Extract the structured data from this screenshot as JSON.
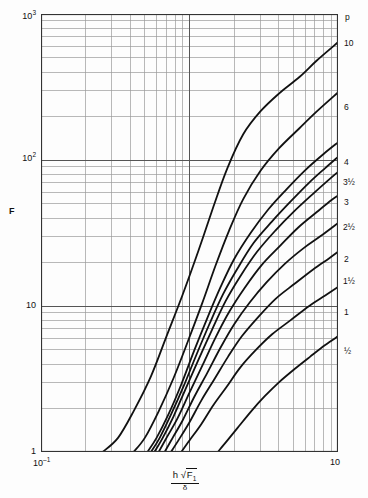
{
  "chart_data": {
    "type": "line",
    "title": "",
    "xlabel": "h √F₁ / δ",
    "ylabel": "F",
    "xscale": "log",
    "yscale": "log",
    "xlim": [
      0.1,
      10
    ],
    "ylim": [
      1,
      1000
    ],
    "grid": true,
    "legend_position": "right-edge-curve-labels",
    "legend_title": "p",
    "x_tick_labels": [
      "10⁻¹",
      "10"
    ],
    "y_tick_labels": [
      "10³",
      "10²",
      "10",
      "1"
    ],
    "y_tick_values": [
      1000,
      100,
      10,
      1
    ],
    "x_tick_values": [
      0.1,
      10
    ],
    "series": [
      {
        "name": "10",
        "label": "10",
        "points": [
          [
            0.26,
            1.0
          ],
          [
            0.33,
            1.25
          ],
          [
            0.42,
            1.9
          ],
          [
            0.55,
            3.3
          ],
          [
            0.7,
            6.2
          ],
          [
            0.9,
            12
          ],
          [
            1.15,
            24
          ],
          [
            1.45,
            48
          ],
          [
            1.8,
            88
          ],
          [
            2.3,
            150
          ],
          [
            3.0,
            215
          ],
          [
            4.0,
            285
          ],
          [
            5.5,
            370
          ],
          [
            7.2,
            480
          ],
          [
            10,
            640
          ]
        ]
      },
      {
        "name": "6",
        "label": "6",
        "points": [
          [
            0.42,
            1.0
          ],
          [
            0.5,
            1.25
          ],
          [
            0.62,
            1.9
          ],
          [
            0.78,
            3.2
          ],
          [
            0.98,
            5.8
          ],
          [
            1.22,
            10.5
          ],
          [
            1.5,
            19
          ],
          [
            1.85,
            33
          ],
          [
            2.3,
            54
          ],
          [
            3.0,
            84
          ],
          [
            4.0,
            120
          ],
          [
            5.5,
            165
          ],
          [
            7.2,
            215
          ],
          [
            10,
            290
          ]
        ]
      },
      {
        "name": "4",
        "label": "4",
        "points": [
          [
            0.52,
            1.0
          ],
          [
            0.6,
            1.25
          ],
          [
            0.72,
            1.8
          ],
          [
            0.88,
            2.9
          ],
          [
            1.08,
            5.0
          ],
          [
            1.32,
            8.3
          ],
          [
            1.62,
            13.5
          ],
          [
            2.0,
            21
          ],
          [
            2.6,
            32
          ],
          [
            3.4,
            46
          ],
          [
            4.5,
            63
          ],
          [
            6.0,
            85
          ],
          [
            8.0,
            110
          ],
          [
            10,
            132
          ]
        ]
      },
      {
        "name": "3½",
        "label": "3½",
        "points": [
          [
            0.55,
            1.0
          ],
          [
            0.63,
            1.25
          ],
          [
            0.75,
            1.8
          ],
          [
            0.91,
            2.8
          ],
          [
            1.11,
            4.6
          ],
          [
            1.36,
            7.5
          ],
          [
            1.68,
            12
          ],
          [
            2.1,
            18
          ],
          [
            2.7,
            27
          ],
          [
            3.6,
            38
          ],
          [
            4.8,
            52
          ],
          [
            6.4,
            70
          ],
          [
            8.2,
            88
          ],
          [
            10,
            105
          ]
        ]
      },
      {
        "name": "3",
        "label": "3",
        "points": [
          [
            0.58,
            1.0
          ],
          [
            0.66,
            1.25
          ],
          [
            0.78,
            1.75
          ],
          [
            0.94,
            2.7
          ],
          [
            1.15,
            4.3
          ],
          [
            1.42,
            6.9
          ],
          [
            1.75,
            10.8
          ],
          [
            2.2,
            16
          ],
          [
            2.85,
            23.5
          ],
          [
            3.8,
            33
          ],
          [
            5.0,
            44
          ],
          [
            6.7,
            58
          ],
          [
            8.5,
            72
          ],
          [
            10,
            83
          ]
        ]
      },
      {
        "name": "2½",
        "label": "2½",
        "points": [
          [
            0.62,
            1.0
          ],
          [
            0.7,
            1.25
          ],
          [
            0.83,
            1.7
          ],
          [
            1.0,
            2.55
          ],
          [
            1.22,
            3.9
          ],
          [
            1.5,
            6.1
          ],
          [
            1.86,
            9.2
          ],
          [
            2.35,
            13.3
          ],
          [
            3.05,
            19
          ],
          [
            4.1,
            26
          ],
          [
            5.4,
            34.5
          ],
          [
            7.2,
            44
          ],
          [
            9.0,
            53
          ],
          [
            10,
            57
          ]
        ]
      },
      {
        "name": "2",
        "label": "2",
        "points": [
          [
            0.68,
            1.0
          ],
          [
            0.77,
            1.25
          ],
          [
            0.9,
            1.65
          ],
          [
            1.08,
            2.4
          ],
          [
            1.32,
            3.5
          ],
          [
            1.62,
            5.2
          ],
          [
            2.0,
            7.5
          ],
          [
            2.55,
            10.6
          ],
          [
            3.3,
            14.5
          ],
          [
            4.4,
            19.5
          ],
          [
            5.9,
            25
          ],
          [
            7.6,
            30
          ],
          [
            10,
            37
          ]
        ]
      },
      {
        "name": "1½",
        "label": "1½",
        "points": [
          [
            0.75,
            1.0
          ],
          [
            0.85,
            1.22
          ],
          [
            1.0,
            1.6
          ],
          [
            1.2,
            2.25
          ],
          [
            1.47,
            3.15
          ],
          [
            1.82,
            4.5
          ],
          [
            2.25,
            6.2
          ],
          [
            2.9,
            8.4
          ],
          [
            3.8,
            11.2
          ],
          [
            5.1,
            14.2
          ],
          [
            6.8,
            17.8
          ],
          [
            8.6,
            21
          ],
          [
            10,
            23.5
          ]
        ]
      },
      {
        "name": "1",
        "label": "1",
        "points": [
          [
            0.88,
            1.0
          ],
          [
            1.0,
            1.2
          ],
          [
            1.2,
            1.55
          ],
          [
            1.45,
            2.1
          ],
          [
            1.78,
            2.8
          ],
          [
            2.2,
            3.8
          ],
          [
            2.8,
            5.0
          ],
          [
            3.6,
            6.4
          ],
          [
            4.8,
            8.0
          ],
          [
            6.4,
            10.0
          ],
          [
            8.2,
            11.8
          ],
          [
            10,
            13.5
          ]
        ]
      },
      {
        "name": "½",
        "label": "½",
        "points": [
          [
            1.55,
            1.0
          ],
          [
            1.8,
            1.2
          ],
          [
            2.15,
            1.5
          ],
          [
            2.6,
            1.9
          ],
          [
            3.2,
            2.4
          ],
          [
            4.0,
            3.0
          ],
          [
            5.1,
            3.7
          ],
          [
            6.5,
            4.5
          ],
          [
            8.2,
            5.4
          ],
          [
            10,
            6.2
          ]
        ]
      }
    ]
  },
  "axes": {
    "y_title": "F",
    "x_left_tick": "10⁻¹",
    "x_right_tick": "10",
    "x_title_numerator_h": "h",
    "x_title_numerator_radical": "√",
    "x_title_numerator_F": "F",
    "x_title_numerator_F_sub": "1",
    "x_title_denominator": "δ",
    "y_ticks": [
      {
        "label_base": "10",
        "label_exp": "3",
        "value": 1000
      },
      {
        "label_base": "10",
        "label_exp": "2",
        "value": 100
      },
      {
        "label_base": "10",
        "label_exp": "",
        "value": 10
      },
      {
        "label_base": "1",
        "label_exp": "",
        "value": 1
      }
    ]
  },
  "legend": {
    "header": "p",
    "entries": [
      "10",
      "6",
      "4",
      "3½",
      "3",
      "2½",
      "2",
      "1½",
      "1",
      "½"
    ]
  },
  "style": {
    "curve_color": "#111111",
    "grid_major_color": "#555555",
    "grid_minor_color": "#9a9a9a",
    "frame_color": "#333333",
    "background": "#fdfdfd"
  }
}
